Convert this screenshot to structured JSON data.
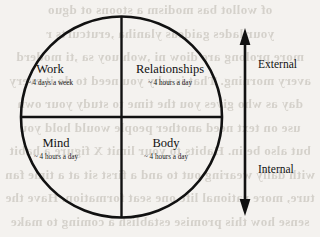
{
  "page": {
    "background_color": "#f4f2ef",
    "ink_color": "#111111",
    "bleed_text_color": "#8e8779"
  },
  "diagram": {
    "type": "quadrant-circle",
    "shape": "circle-divided-into-four-quadrants",
    "quadrants": [
      {
        "id": "work",
        "position": "top-left",
        "title": "Work",
        "subtitle": "~ 4 days a week",
        "axis_group": "External"
      },
      {
        "id": "relationships",
        "position": "top-right",
        "title": "Relationships",
        "subtitle": "~ 4 hours a day",
        "axis_group": "External"
      },
      {
        "id": "mind",
        "position": "bottom-left",
        "title": "Mind",
        "subtitle": "~ 4 hours a day",
        "axis_group": "Internal"
      },
      {
        "id": "body",
        "position": "bottom-right",
        "title": "Body",
        "subtitle": "~ 4 hours a day",
        "axis_group": "Internal"
      }
    ]
  },
  "axis": {
    "orientation": "vertical",
    "style": "double-headed-arrow",
    "top_label": "External",
    "bottom_label": "Internal"
  },
  "bleed_through_lines": [
    "of wollot bas modism a stoons ot dguo",
    "your lades gaideas ylaniha ,erutcurts r",
    "more prolong are diow ni ,woh uoy sa ,ti moderd",
    "avery morning. That is why you need to do it every",
    "day as who gives you the time to study your own",
    "use on text need another people would hold you",
    "but also be in. Habits to your limit X figure a habit",
    "with daily wearing out to and a first sit at a time fan",
    "ture, more rational life one seat formation. Have the",
    "sense how this promise establish a coming to make"
  ]
}
